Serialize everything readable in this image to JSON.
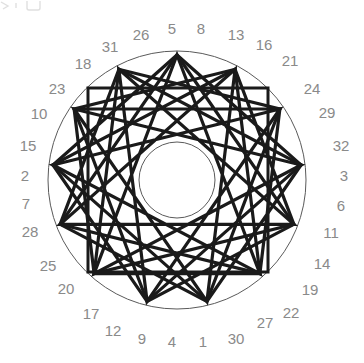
{
  "figure": {
    "background_color": "#ffffff",
    "stroke_color": "#1a1a1a",
    "thin_stroke_color": "#5a5a5a",
    "label_color": "#8a8a8a",
    "center": {
      "x": 177,
      "y": 180
    },
    "outer_circle": {
      "radius": 129,
      "stroke_width": 1
    },
    "inner_circle": {
      "radius": 38,
      "stroke_width": 1
    },
    "square": {
      "x": 88,
      "y": 88,
      "width": 180,
      "height": 184,
      "stroke_width": 3
    },
    "star_vertex_count": 13,
    "star_radius": 125,
    "star_steps": [
      5,
      4,
      3
    ],
    "star_rotation_deg": -90,
    "stroke_width_star": 3.2
  },
  "ring_labels": {
    "description": "Numeric labels placed radially around the outer circle, read clockwise starting at the top",
    "radius": 150,
    "start_angle_deg": -90,
    "count": 32,
    "values": [
      "5",
      "8",
      "13",
      "16",
      "21",
      "24",
      "29",
      "32",
      "3",
      "6",
      "11",
      "14",
      "19",
      "22",
      "27",
      "30",
      "1",
      "4",
      "9",
      "12",
      "17",
      "20",
      "25",
      "28",
      "7",
      "2",
      "15",
      "10",
      "23",
      "18",
      "31",
      "26"
    ]
  },
  "label_positions": [
    {
      "value": "5",
      "x": 172,
      "y": 28
    },
    {
      "value": "8",
      "x": 201,
      "y": 28
    },
    {
      "value": "13",
      "x": 236,
      "y": 34
    },
    {
      "value": "16",
      "x": 264,
      "y": 44
    },
    {
      "value": "21",
      "x": 290,
      "y": 60
    },
    {
      "value": "24",
      "x": 312,
      "y": 88
    },
    {
      "value": "29",
      "x": 327,
      "y": 112
    },
    {
      "value": "32",
      "x": 341,
      "y": 145
    },
    {
      "value": "3",
      "x": 344,
      "y": 175
    },
    {
      "value": "6",
      "x": 341,
      "y": 205
    },
    {
      "value": "11",
      "x": 331,
      "y": 232
    },
    {
      "value": "14",
      "x": 322,
      "y": 263
    },
    {
      "value": "19",
      "x": 310,
      "y": 289
    },
    {
      "value": "22",
      "x": 291,
      "y": 312
    },
    {
      "value": "27",
      "x": 265,
      "y": 322
    },
    {
      "value": "30",
      "x": 236,
      "y": 338
    },
    {
      "value": "1",
      "x": 203,
      "y": 341
    },
    {
      "value": "4",
      "x": 172,
      "y": 341
    },
    {
      "value": "9",
      "x": 142,
      "y": 338
    },
    {
      "value": "12",
      "x": 113,
      "y": 330
    },
    {
      "value": "17",
      "x": 91,
      "y": 313
    },
    {
      "value": "20",
      "x": 66,
      "y": 288
    },
    {
      "value": "25",
      "x": 48,
      "y": 265
    },
    {
      "value": "28",
      "x": 30,
      "y": 231
    },
    {
      "value": "7",
      "x": 26,
      "y": 203
    },
    {
      "value": "2",
      "x": 25,
      "y": 175
    },
    {
      "value": "15",
      "x": 28,
      "y": 145
    },
    {
      "value": "10",
      "x": 39,
      "y": 113
    },
    {
      "value": "23",
      "x": 57,
      "y": 88
    },
    {
      "value": "18",
      "x": 83,
      "y": 63
    },
    {
      "value": "31",
      "x": 110,
      "y": 46
    },
    {
      "value": "26",
      "x": 141,
      "y": 34
    }
  ]
}
